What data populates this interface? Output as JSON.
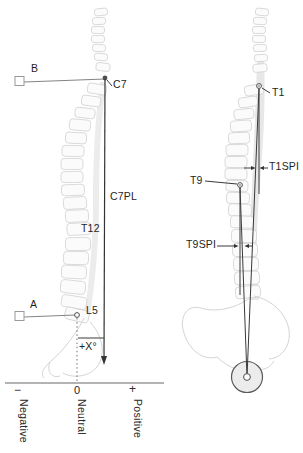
{
  "figure": {
    "left": {
      "label_b": "B",
      "label_c7": "C7",
      "label_c7pl": "C7PL",
      "label_t12": "T12",
      "label_a": "A",
      "label_l5": "L5",
      "label_angle": "+X°",
      "axis_minus": "−",
      "axis_zero": "0",
      "axis_plus": "+",
      "axis_negative": "Negative",
      "axis_neutral": "Neutral",
      "axis_positive": "Positive"
    },
    "right": {
      "label_t1": "T1",
      "label_t1spi": "T1SPI",
      "label_t9": "T9",
      "label_t9spi": "T9SPI"
    },
    "colors": {
      "annotation_line": "#3a3a3a",
      "reference_line": "#848484",
      "sketch_gray": "#d4d4d4",
      "shade_gray": "#e9e9e9",
      "text": "#1f1f1f"
    }
  }
}
